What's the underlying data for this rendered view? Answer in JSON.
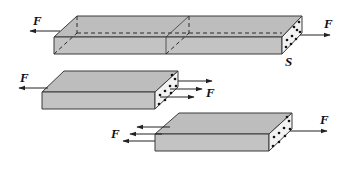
{
  "diagram": {
    "labels": {
      "top_left_force": "F",
      "top_right_force": "F",
      "section": "S",
      "middle_left_force": "F",
      "middle_right_force": "F",
      "bottom_left_force": "F",
      "bottom_right_force": "F"
    },
    "colors": {
      "face": "#c3c3c3",
      "end_face": "#f2f2f2",
      "line": "#3a3a3a"
    }
  }
}
